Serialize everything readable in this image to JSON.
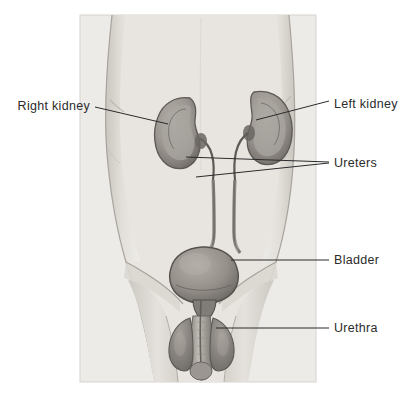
{
  "figure": {
    "panel": {
      "x": 80,
      "y": 15,
      "width": 236,
      "height": 367,
      "background": "#eceae6",
      "border_color": "#d8d5d0"
    },
    "page_background": "#ffffff",
    "ink_color": "#2b2b2b",
    "organ_tone": "#8f8b87",
    "body_tone": "#e4e1dc"
  },
  "labels": {
    "right_kidney": "Right kidney",
    "left_kidney": "Left kidney",
    "ureters": "Ureters",
    "bladder": "Bladder",
    "urethra": "Urethra"
  },
  "leader_lines": [
    {
      "name": "right-kidney-leader",
      "points": "95,107 168,124"
    },
    {
      "name": "left-kidney-leader",
      "points": "329,101 256,120"
    },
    {
      "name": "ureters-leader-upper",
      "points": "329,162 186,157"
    },
    {
      "name": "ureters-leader-lower",
      "points": "329,163 196,177"
    },
    {
      "name": "bladder-leader",
      "points": "329,260 231,260"
    },
    {
      "name": "urethra-leader",
      "points": "329,328 216,328"
    }
  ],
  "structures": [
    {
      "name": "right-kidney",
      "side": "left-of-image",
      "vertical_position": "lower"
    },
    {
      "name": "left-kidney",
      "side": "right-of-image",
      "vertical_position": "higher"
    },
    {
      "name": "right-ureter",
      "description": "tube from right kidney to bladder"
    },
    {
      "name": "left-ureter",
      "description": "tube from left kidney to bladder"
    },
    {
      "name": "bladder",
      "description": "rounded sac above pelvis"
    },
    {
      "name": "urethra",
      "description": "tube descending through penis"
    },
    {
      "name": "torso-outline",
      "description": "male abdomen, hips and thighs"
    }
  ]
}
